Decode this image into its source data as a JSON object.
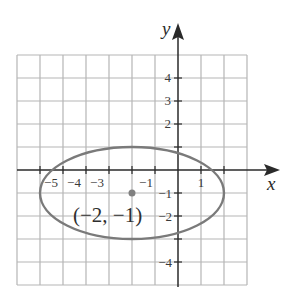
{
  "diagram": {
    "x_axis_label": "x",
    "y_axis_label": "y",
    "x_tick_labels": [
      "−5",
      "−4",
      "−3",
      "−1",
      "1"
    ],
    "y_tick_labels": [
      "4",
      "3",
      "2",
      "−1",
      "−2",
      "−4"
    ],
    "center_label": "(−2, −1)",
    "ellipse": {
      "center": [
        -2,
        -1
      ],
      "semi_axis_horizontal": 4,
      "semi_axis_vertical": 2
    },
    "grid": {
      "x_range": [
        -7,
        3
      ],
      "y_range": [
        -5,
        5
      ]
    },
    "colors": {
      "grid": "#b5b5b5",
      "axis": "#2a2a2a",
      "ellipse": "#7a7a7a",
      "center_point": "#808080"
    }
  }
}
